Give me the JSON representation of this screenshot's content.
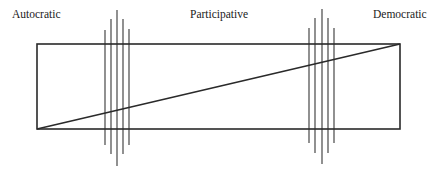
{
  "diagram": {
    "labels": {
      "left": "Autocratic",
      "center": "Participative",
      "right": "Democratic"
    },
    "colors": {
      "outline": "#2a2a2a",
      "divider": "#555555",
      "text": "#1a1a1a"
    },
    "rectangle": {
      "x1": 37,
      "y1": 44,
      "x2": 400,
      "y2": 129
    },
    "diagonal": {
      "from": [
        37,
        129
      ],
      "to": [
        400,
        44
      ]
    },
    "divider_groups": [
      {
        "name": "left",
        "lines": [
          {
            "x": 105,
            "top": 30,
            "bottom": 145
          },
          {
            "x": 111,
            "top": 19,
            "bottom": 154
          },
          {
            "x": 117,
            "top": 10,
            "bottom": 166
          },
          {
            "x": 123,
            "top": 19,
            "bottom": 154
          },
          {
            "x": 129,
            "top": 29,
            "bottom": 145
          }
        ]
      },
      {
        "name": "right",
        "lines": [
          {
            "x": 309,
            "top": 28,
            "bottom": 143
          },
          {
            "x": 315,
            "top": 18,
            "bottom": 153
          },
          {
            "x": 322,
            "top": 9,
            "bottom": 164
          },
          {
            "x": 328,
            "top": 18,
            "bottom": 153
          },
          {
            "x": 334,
            "top": 28,
            "bottom": 143
          }
        ]
      }
    ]
  }
}
